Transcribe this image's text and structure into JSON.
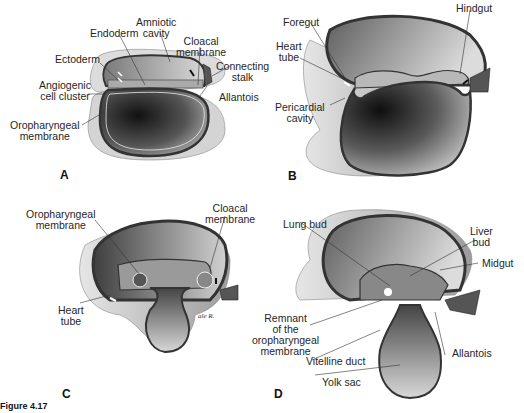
{
  "figure": {
    "caption_label": "Figure 4.17",
    "caption_text": "",
    "signature": "ale R."
  },
  "panels": [
    {
      "id": "A",
      "letter": "A",
      "labels": {
        "amniotic_cavity": "Amniotic\ncavity",
        "endoderm": "Endoderm",
        "cloacal_membrane": "Cloacal\nmembrane",
        "ectoderm": "Ectoderm",
        "connecting_stalk": "Connecting\nstalk",
        "angiogenic_cell_cluster": "Angiogenic\ncell cluster",
        "allantois": "Allantois",
        "oropharyngeal_membrane": "Oropharyngeal\nmembrane"
      }
    },
    {
      "id": "B",
      "letter": "B",
      "labels": {
        "foregut": "Foregut",
        "hindgut": "Hindgut",
        "heart_tube": "Heart\ntube",
        "pericardial_cavity": "Pericardial\ncavity"
      }
    },
    {
      "id": "C",
      "letter": "C",
      "labels": {
        "oropharyngeal_membrane": "Oropharyngeal\nmembrane",
        "cloacal_membrane": "Cloacal\nmembrane",
        "heart_tube": "Heart\ntube"
      }
    },
    {
      "id": "D",
      "letter": "D",
      "labels": {
        "lung_bud": "Lung bud",
        "liver_bud": "Liver\nbud",
        "midgut": "Midgut",
        "remnant_oropharyngeal": "Remnant\nof the\noropharyngeal\nmembrane",
        "vitelline_duct": "Vitelline duct",
        "allantois": "Allantois",
        "yolk_sac": "Yolk sac"
      }
    }
  ],
  "colors": {
    "outer_layer": "#d9d9d9",
    "wall_dark": "#4a4a4a",
    "yolk_dark": "#2b2b2b",
    "yolk_light": "#a8a8a8",
    "amnion": "#bdbdbd",
    "background": "#ffffff"
  }
}
